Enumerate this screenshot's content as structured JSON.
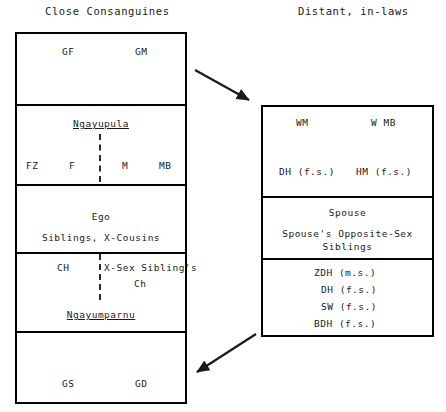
{
  "headers": {
    "left": "Close Consanguines",
    "right": "Distant, in-laws"
  },
  "left_table": {
    "rows": [
      {
        "name": "grandparents-row",
        "labels": [
          "GF",
          "GM"
        ]
      },
      {
        "name": "parents-row",
        "term": "Ngayupula",
        "labels": [
          "FZ",
          "F",
          "M",
          "MB"
        ]
      },
      {
        "name": "ego-row",
        "line1": "Ego",
        "line2": "Siblings, X-Cousins"
      },
      {
        "name": "children-row",
        "left_label": "CH",
        "right_label_line1": "X-Sex Sibling's",
        "right_label_line2": "Ch",
        "term": "Ngayumparnu"
      },
      {
        "name": "grandchildren-row",
        "labels": [
          "GS",
          "GD"
        ]
      }
    ]
  },
  "right_table": {
    "rows": [
      {
        "name": "affines-upper-row",
        "line1_left": "WM",
        "line1_right": "W MB",
        "line2_left": "DH (f.s.)",
        "line2_right": "HM (f.s.)"
      },
      {
        "name": "spouse-row",
        "line1": "Spouse",
        "line2": "Spouse's Opposite-Sex",
        "line3": "Siblings"
      },
      {
        "name": "affines-lower-row",
        "items": [
          "ZDH (m.s.)",
          "DH (f.s.)",
          "SW (f.s.)",
          "BDH (f.s.)"
        ]
      }
    ]
  },
  "arrows": [
    {
      "name": "arrow-top-left-to-right"
    },
    {
      "name": "arrow-bottom-right-to-left"
    }
  ],
  "colors": {
    "line": "#000000",
    "text": "#1a1a1a",
    "background": "#ffffff"
  }
}
